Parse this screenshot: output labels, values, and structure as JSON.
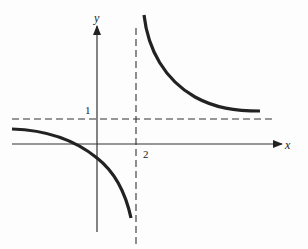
{
  "diagram": {
    "type": "rational-function-graph",
    "axes": {
      "x_label": "x",
      "y_label": "y"
    },
    "asymptotes": {
      "vertical": {
        "value": 2,
        "label": "2"
      },
      "horizontal": {
        "value": 1,
        "label": "1"
      }
    },
    "curve": {
      "color": "#222222",
      "branches": [
        "upper-right",
        "lower-left"
      ]
    }
  }
}
